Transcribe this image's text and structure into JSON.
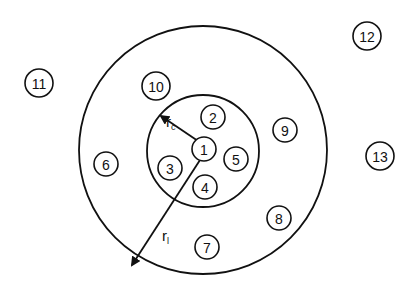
{
  "diagram": {
    "type": "concentric-circles",
    "stroke_color": "#111111",
    "background": "#ffffff",
    "outer_circle": {
      "cx": 203,
      "cy": 150,
      "r": 124
    },
    "inner_circle": {
      "cx": 203,
      "cy": 151,
      "r": 56
    },
    "radius_labels": {
      "rc": {
        "main": "r",
        "sub": "c",
        "x": 166,
        "y": 127
      },
      "rl": {
        "main": "r",
        "sub": "l",
        "x": 162,
        "y": 241
      }
    },
    "arrows": [
      {
        "name": "rc-arrow",
        "x1": 198,
        "y1": 141,
        "x2": 161,
        "y2": 116
      },
      {
        "name": "rl-arrow",
        "x1": 200,
        "y1": 160,
        "x2": 132,
        "y2": 265
      }
    ],
    "node_radius": 13,
    "nodes": [
      {
        "id": "1",
        "x": 204,
        "y": 149
      },
      {
        "id": "2",
        "x": 213,
        "y": 117
      },
      {
        "id": "3",
        "x": 170,
        "y": 168
      },
      {
        "id": "4",
        "x": 205,
        "y": 187
      },
      {
        "id": "5",
        "x": 236,
        "y": 159
      },
      {
        "id": "6",
        "x": 106,
        "y": 164
      },
      {
        "id": "7",
        "x": 207,
        "y": 247
      },
      {
        "id": "8",
        "x": 279,
        "y": 218
      },
      {
        "id": "9",
        "x": 285,
        "y": 130
      },
      {
        "id": "10",
        "x": 156,
        "y": 86
      },
      {
        "id": "11",
        "x": 39,
        "y": 83
      },
      {
        "id": "12",
        "x": 367,
        "y": 36
      },
      {
        "id": "13",
        "x": 380,
        "y": 156
      }
    ]
  }
}
